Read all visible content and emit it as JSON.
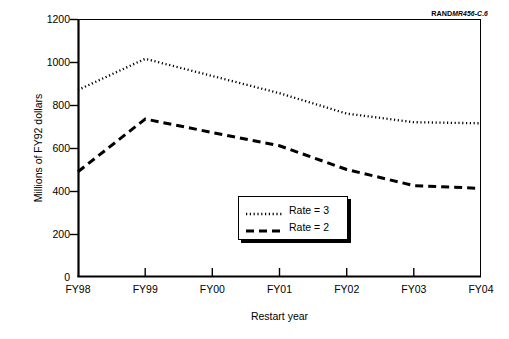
{
  "credit": {
    "brand": "RAND",
    "document": "MR456-C.6"
  },
  "chart_data": {
    "type": "line",
    "title": "",
    "xlabel": "Restart year",
    "ylabel": "Millions of FY92 dollars",
    "categories": [
      "FY98",
      "FY99",
      "FY00",
      "FY01",
      "FY02",
      "FY03",
      "FY04"
    ],
    "x_tick_labels": [
      "FY98",
      "FY99",
      "FY00",
      "FY01",
      "FY02",
      "FY03",
      "FY04"
    ],
    "y_tick_labels": [
      "0",
      "200",
      "400",
      "600",
      "800",
      "1000",
      "1200"
    ],
    "y_ticks": [
      0,
      200,
      400,
      600,
      800,
      1000,
      1200
    ],
    "ylim": [
      0,
      1200
    ],
    "xlim": [
      "FY98",
      "FY04"
    ],
    "grid": false,
    "legend_position": "center-bottom-inside",
    "series": [
      {
        "name": "Rate = 3",
        "style": "dotted",
        "color": "#000000",
        "values": [
          870,
          1015,
          935,
          855,
          760,
          720,
          715
        ]
      },
      {
        "name": "Rate = 2",
        "style": "dashed",
        "color": "#000000",
        "values": [
          490,
          735,
          672,
          610,
          500,
          425,
          412
        ]
      }
    ]
  },
  "legend": {
    "entries": [
      {
        "label": "Rate = 3",
        "swatch": "dotted-line-swatch"
      },
      {
        "label": "Rate = 2",
        "swatch": "dashed-line-swatch"
      }
    ]
  }
}
